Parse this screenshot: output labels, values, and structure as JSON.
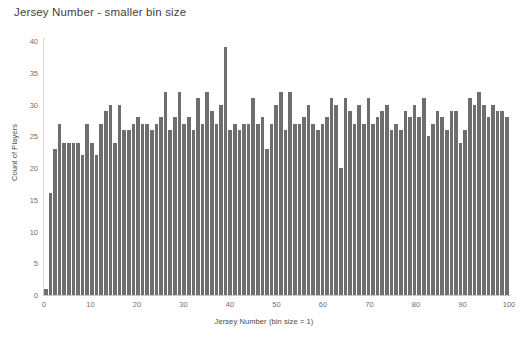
{
  "chart_data": {
    "type": "bar",
    "title": "Jersey Number - smaller bin size",
    "xlabel": "Jersey Number (bin size = 1)",
    "ylabel": "Count of Players",
    "xlim": [
      0,
      100
    ],
    "ylim": [
      0,
      40
    ],
    "ytick_labels": [
      "0",
      "5",
      "10",
      "15",
      "20",
      "25",
      "30",
      "35",
      "40"
    ],
    "ytick_values": [
      0,
      5,
      10,
      15,
      20,
      25,
      30,
      35,
      40
    ],
    "xtick_labels": [
      "0",
      "10",
      "20",
      "30",
      "40",
      "50",
      "60",
      "70",
      "80",
      "90",
      "100"
    ],
    "xtick_values": [
      0,
      10,
      20,
      30,
      40,
      50,
      60,
      70,
      80,
      90,
      100
    ],
    "grid": false,
    "legend": null,
    "bar_color": "#6e6e6e",
    "background": "#ffffff",
    "bin_size": 1,
    "categories": [
      0,
      1,
      2,
      3,
      4,
      5,
      6,
      7,
      8,
      9,
      10,
      11,
      12,
      13,
      14,
      15,
      16,
      17,
      18,
      19,
      20,
      21,
      22,
      23,
      24,
      25,
      26,
      27,
      28,
      29,
      30,
      31,
      32,
      33,
      34,
      35,
      36,
      37,
      38,
      39,
      40,
      41,
      42,
      43,
      44,
      45,
      46,
      47,
      48,
      49,
      50,
      51,
      52,
      53,
      54,
      55,
      56,
      57,
      58,
      59,
      60,
      61,
      62,
      63,
      64,
      65,
      66,
      67,
      68,
      69,
      70,
      71,
      72,
      73,
      74,
      75,
      76,
      77,
      78,
      79,
      80,
      81,
      82,
      83,
      84,
      85,
      86,
      87,
      88,
      89,
      90,
      91,
      92,
      93,
      94,
      95,
      96,
      97,
      98,
      99,
      100
    ],
    "values": [
      1,
      16,
      23,
      27,
      24,
      24,
      24,
      24,
      22,
      27,
      24,
      22,
      27,
      29,
      30,
      24,
      30,
      26,
      26,
      27,
      28,
      27,
      27,
      26,
      27,
      28,
      32,
      26,
      28,
      32,
      27,
      28,
      26,
      31,
      27,
      32,
      29,
      27,
      30,
      39,
      26,
      27,
      26,
      27,
      27,
      31,
      27,
      28,
      23,
      27,
      30,
      32,
      26,
      32,
      27,
      27,
      28,
      30,
      27,
      26,
      27,
      28,
      31,
      30,
      20,
      31,
      29,
      27,
      30,
      27,
      31,
      27,
      28,
      29,
      30,
      26,
      27,
      26,
      29,
      28,
      30,
      28,
      31,
      25,
      27,
      29,
      28,
      26,
      29,
      29,
      24,
      26,
      31,
      30,
      32,
      30,
      28,
      30,
      29,
      29,
      28
    ]
  }
}
